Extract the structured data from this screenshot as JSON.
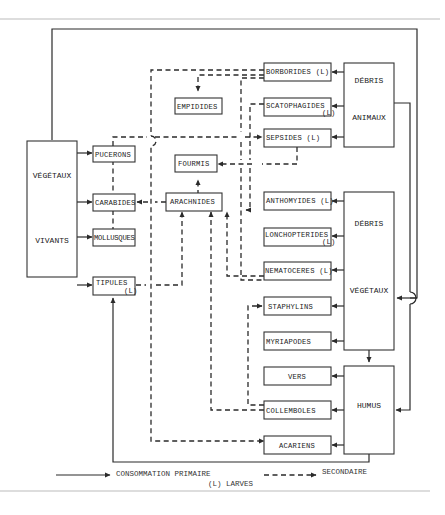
{
  "diagram": {
    "title": "",
    "nodes": {
      "vegetaux_vivants": [
        "VÉGÉTAUX",
        "VIVANTS"
      ],
      "debris_animaux": [
        "DÉBRIS",
        "ANIMAUX"
      ],
      "debris_vegetaux": [
        "DÉBRIS",
        "VÉGÉTAUX"
      ],
      "humus": "HUMUS",
      "pucerons": "PUCERONS",
      "carabides": "CARABIDES",
      "mollusques": "MOLLUSQUES",
      "tipules": "TIPULES",
      "tipules_suffix": "(L)",
      "empidides": "EMPIDIDES",
      "fourmis": "FOURMIS",
      "arachnides": "ARACHNIDES",
      "borborides": "BORBORIDES (L)",
      "scatophagides": "SCATOPHAGIDES",
      "scatophagides_suffix": "(L)",
      "sepsides": "SEPSIDES (L)",
      "anthomyides": "ANTHOMYIDES (L)",
      "lonchopterides": "LONCHOPTERIDES",
      "lonchopterides_suffix": "(L)",
      "nematoceres": "NEMATOCERES (L)",
      "staphylins": "STAPHYLINS",
      "myriapodes": "MYRIAPODES",
      "vers": "VERS",
      "collemboles": "COLLEMBOLES",
      "acariens": "ACARIENS"
    },
    "legend": {
      "primary": "CONSOMMATION  PRIMAIRE",
      "secondary": "SECONDAIRE",
      "larvae_note": "(L) LARVES"
    }
  }
}
